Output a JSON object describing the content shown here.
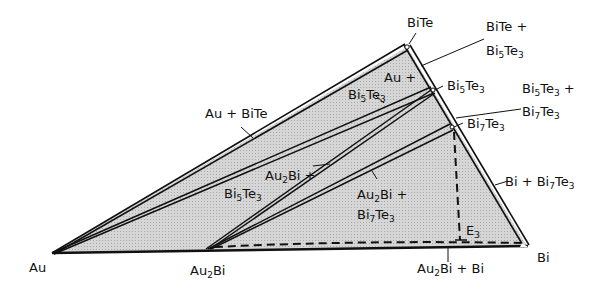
{
  "diagram": {
    "type": "ternary-phase-section",
    "fill_color": "#cfcfcf",
    "line_color": "#111111",
    "vertices": {
      "Au": {
        "label": "Au"
      },
      "Au2Bi": {
        "label_main": "Au",
        "label_sub": "2",
        "label_tail": "Bi"
      },
      "Bi": {
        "label": "Bi"
      },
      "BiTe": {
        "label": "BiTe"
      },
      "Bi5Te3": {
        "a": "Bi",
        "s1": "5",
        "b": "Te",
        "s2": "3"
      },
      "Bi7Te3": {
        "a": "Bi",
        "s1": "7",
        "b": "Te",
        "s2": "3"
      }
    },
    "regions": {
      "au_bite": "Au + BiTe",
      "bite_bi5te3_l1": "BiTe +",
      "bite_bi5te3_l2": {
        "a": "Bi",
        "s1": "5",
        "b": "Te",
        "s2": "3"
      },
      "au_bi5te3_l1": "Au +",
      "au_bi5te3_l2": {
        "a": "Bi",
        "s1": "5",
        "b": "Te",
        "s2": "3"
      },
      "bi5te3_bi7te3_l1": {
        "a": "Bi",
        "s1": "5",
        "b": "Te",
        "s2": "3",
        "tail": " +"
      },
      "bi5te3_bi7te3_l2": {
        "a": "Bi",
        "s1": "7",
        "b": "Te",
        "s2": "3"
      },
      "au2bi_bi5te3_l1": {
        "a": "Au",
        "s1": "2",
        "b": "Bi +"
      },
      "au2bi_bi5te3_l2": {
        "a": "Bi",
        "s1": "5",
        "b": "Te",
        "s2": "3"
      },
      "au2bi_bi7te3_l1": {
        "a": "Au",
        "s1": "2",
        "b": "Bi +"
      },
      "au2bi_bi7te3_l2": {
        "a": "Bi",
        "s1": "7",
        "b": "Te",
        "s2": "3"
      },
      "bi_bi7te3": {
        "a": "Bi + Bi",
        "s1": "7",
        "b": "Te",
        "s2": "3"
      },
      "au2bi_bi": {
        "a": "Au",
        "s1": "2",
        "b": "Bi + Bi"
      },
      "eutectic": {
        "a": "E",
        "s1": "3"
      }
    }
  }
}
